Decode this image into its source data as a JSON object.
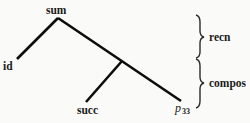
{
  "diagram": {
    "type": "tree",
    "nodes": {
      "root": {
        "label": "sum"
      },
      "left_leaf": {
        "label": "id"
      },
      "inner_leaf": {
        "label": "succ"
      },
      "right_leaf": {
        "label": "p",
        "subscript": "33"
      }
    },
    "edges": [
      {
        "from": "sum",
        "to": "id"
      },
      {
        "from": "sum",
        "to": "p33"
      },
      {
        "from": "junction",
        "to": "succ"
      }
    ],
    "braces": [
      {
        "label": "recn"
      },
      {
        "label": "compos"
      }
    ]
  }
}
